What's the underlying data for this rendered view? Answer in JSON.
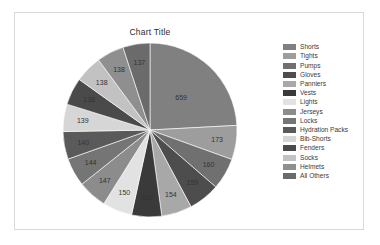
{
  "chart": {
    "title": "Chart Title"
  },
  "chart_data": {
    "type": "pie",
    "title": "Chart Title",
    "xlabel": "",
    "ylabel": "",
    "legend_position": "right",
    "grid": false,
    "categories": [
      "Shorts",
      "Tights",
      "Pumps",
      "Gloves",
      "Panniers",
      "Vests",
      "Lights",
      "Jerseys",
      "Locks",
      "Hydration Packs",
      "Bib-Shorts",
      "Fenders",
      "Socks",
      "Helmets",
      "All Others"
    ],
    "values": [
      659,
      173,
      160,
      159,
      154,
      152,
      150,
      147,
      144,
      140,
      139,
      138,
      138,
      138,
      137
    ],
    "labels": [
      "659",
      "173",
      "160",
      "159",
      "154",
      "152",
      "150",
      "147",
      "144",
      "140",
      "139",
      "138",
      "138",
      "138",
      "137"
    ],
    "colors": [
      "#808080",
      "#9d9d9d",
      "#707070",
      "#4d4d4d",
      "#a8a8a8",
      "#3a3a3a",
      "#e2e2e2",
      "#8c8c8c",
      "#757575",
      "#5a5a5a",
      "#d6d6d6",
      "#4a4a4a",
      "#c2c2c2",
      "#8f8f8f",
      "#6b6b6b"
    ],
    "start_angle": -90,
    "direction": "clockwise"
  },
  "legend": {
    "items": [
      {
        "label": "Shorts",
        "color": "#808080"
      },
      {
        "label": "Tights",
        "color": "#9d9d9d"
      },
      {
        "label": "Pumps",
        "color": "#707070"
      },
      {
        "label": "Gloves",
        "color": "#4d4d4d"
      },
      {
        "label": "Panniers",
        "color": "#a8a8a8"
      },
      {
        "label": "Vests",
        "color": "#3a3a3a"
      },
      {
        "label": "Lights",
        "color": "#e2e2e2"
      },
      {
        "label": "Jerseys",
        "color": "#8c8c8c"
      },
      {
        "label": "Locks",
        "color": "#757575"
      },
      {
        "label": "Hydration Packs",
        "color": "#5a5a5a"
      },
      {
        "label": "Bib-Shorts",
        "color": "#d6d6d6"
      },
      {
        "label": "Fenders",
        "color": "#4a4a4a"
      },
      {
        "label": "Socks",
        "color": "#c2c2c2"
      },
      {
        "label": "Helmets",
        "color": "#8f8f8f"
      },
      {
        "label": "All Others",
        "color": "#6b6b6b"
      }
    ]
  }
}
